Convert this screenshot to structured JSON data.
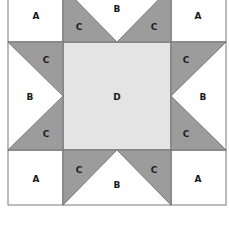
{
  "diagram": {
    "title": "",
    "colors": {
      "white": "#ffffff",
      "dark": "#9c9c9c",
      "light": "#e4e4e4",
      "line": "#7a7a7a"
    },
    "labels": {
      "a_tl": "A",
      "a_tr": "A",
      "a_bl": "A",
      "a_br": "A",
      "b_top": "B",
      "b_left": "B",
      "b_right": "B",
      "b_bottom": "B",
      "c_top_left": "C",
      "c_top_right": "C",
      "c_left_top": "C",
      "c_left_bottom": "C",
      "c_right_top": "C",
      "c_right_bottom": "C",
      "c_bottom_left": "C",
      "c_bottom_right": "C",
      "d_center": "D"
    }
  }
}
